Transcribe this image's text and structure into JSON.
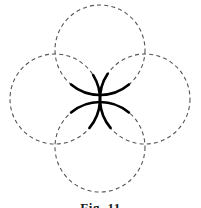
{
  "figure": {
    "background_color": "#ffffff",
    "dash_color": "#555555",
    "arc_color": "#000000",
    "dash_stroke_width": 1.1,
    "arc_stroke_width": 2.6,
    "dash_pattern": "4 3.2",
    "radius": 45,
    "canvas": {
      "width": 201,
      "height": 208
    },
    "circles": [
      {
        "id": "top",
        "label": "top-circle",
        "cx": 100,
        "cy": 50,
        "r": 45,
        "solid_arc": {
          "start_deg": 50,
          "end_deg": 130,
          "facing": "down"
        }
      },
      {
        "id": "left",
        "label": "left-circle",
        "cx": 55,
        "cy": 99,
        "r": 45,
        "solid_arc": {
          "start_deg": -32,
          "end_deg": 40,
          "facing": "right"
        }
      },
      {
        "id": "right",
        "label": "right-circle",
        "cx": 145,
        "cy": 99,
        "r": 45,
        "solid_arc": {
          "start_deg": 140,
          "end_deg": 214,
          "facing": "left"
        }
      },
      {
        "id": "bottom",
        "label": "bottom-circle",
        "cx": 100,
        "cy": 147,
        "r": 45,
        "solid_arc": {
          "start_deg": 230,
          "end_deg": 310,
          "facing": "up"
        }
      }
    ]
  },
  "caption": {
    "text": "Fig. 11",
    "visible_fragment": "Fig. 11",
    "cropped": true,
    "top": 201
  }
}
